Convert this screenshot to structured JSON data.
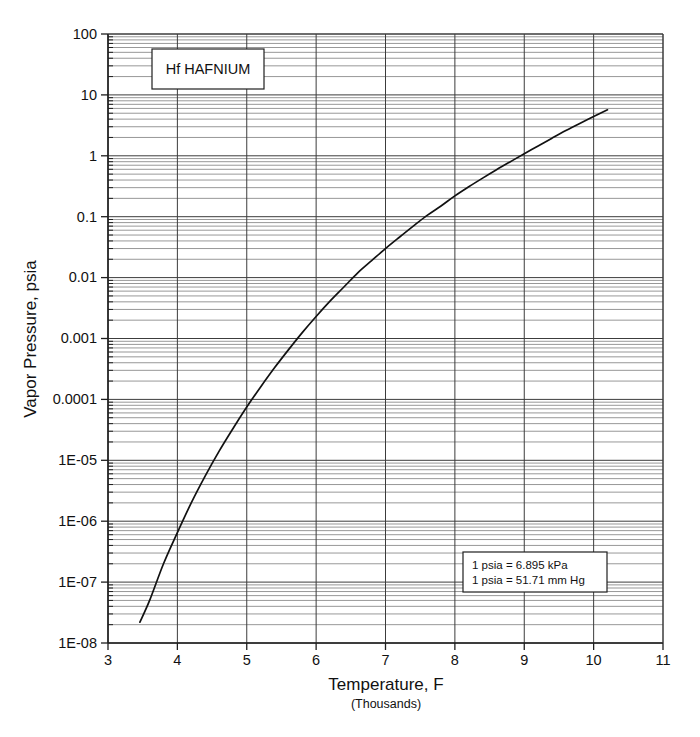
{
  "chart_data": {
    "type": "line",
    "title": "Hf   HAFNIUM",
    "element_symbol": "Hf",
    "element_name": "HAFNIUM",
    "xlabel": "Temperature, F",
    "xsublabel": "(Thousands)",
    "ylabel": "Vapor Pressure, psia",
    "xscale": "linear",
    "yscale": "log",
    "xlim": [
      3,
      11
    ],
    "ylim": [
      1e-08,
      100
    ],
    "grid": true,
    "grid_minor": true,
    "legend": "none",
    "xticks": [
      3,
      4,
      5,
      6,
      7,
      8,
      9,
      10,
      11
    ],
    "xticklabels": [
      "3",
      "4",
      "5",
      "6",
      "7",
      "8",
      "9",
      "10",
      "11"
    ],
    "yticks": [
      100,
      10,
      1,
      0.1,
      0.01,
      0.001,
      0.0001,
      1e-05,
      1e-06,
      1e-07,
      1e-08
    ],
    "yticklabels": [
      "100",
      "10",
      "1",
      "0.1",
      "0.01",
      "0.001",
      "0.0001",
      "1E-05",
      "1E-06",
      "1E-07",
      "1E-08"
    ],
    "series": [
      {
        "name": "Hf vapor pressure",
        "x": [
          3.46,
          3.6,
          3.8,
          4.0,
          4.2,
          4.4,
          4.6,
          4.8,
          5.0,
          5.2,
          5.4,
          5.6,
          5.8,
          6.0,
          6.2,
          6.4,
          6.6,
          6.8,
          7.0,
          7.2,
          7.4,
          7.6,
          7.8,
          8.0,
          8.2,
          8.4,
          8.6,
          8.8,
          9.0,
          9.2,
          9.4,
          9.6,
          9.8,
          10.0,
          10.2
        ],
        "y": [
          2.2e-08,
          5e-08,
          2e-07,
          6.5e-07,
          2e-06,
          5.5e-06,
          1.4e-05,
          3.3e-05,
          7.5e-05,
          0.00016,
          0.00033,
          0.00065,
          0.00125,
          0.0023,
          0.0041,
          0.007,
          0.012,
          0.019,
          0.03,
          0.046,
          0.07,
          0.105,
          0.15,
          0.22,
          0.31,
          0.43,
          0.59,
          0.8,
          1.08,
          1.45,
          1.95,
          2.6,
          3.4,
          4.4,
          5.7
        ]
      }
    ],
    "annotations": [
      {
        "name": "unit-conversion-note",
        "lines": [
          "1 psia = 6.895 kPa",
          "1 psia = 51.71 mm Hg"
        ]
      }
    ]
  },
  "title_box": {
    "label": "Hf   HAFNIUM"
  },
  "note_box": {
    "line1": "1 psia = 6.895 kPa",
    "line2": "1 psia = 51.71 mm Hg"
  },
  "axes": {
    "xlabel": "Temperature, F",
    "xsublabel": "(Thousands)",
    "ylabel": "Vapor Pressure, psia"
  },
  "colors": {
    "curve": "#111111",
    "grid_major": "#3c3c3c",
    "grid_minor": "#6b6b6b",
    "axis": "#1e1e1e",
    "background": "#ffffff"
  }
}
